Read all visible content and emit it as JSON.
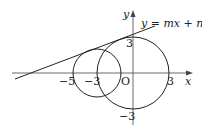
{
  "diagram": {
    "type": "coordinate-geometry",
    "axes": {
      "x_label": "x",
      "y_label": "y",
      "origin_label": "O"
    },
    "tick_labels": {
      "x_neg5": "−5",
      "x_neg3": "−3",
      "x_pos3": "3",
      "y_pos3": "3",
      "y_neg3": "−3"
    },
    "line": {
      "equation_label": "y = mx + n"
    },
    "circles": [
      {
        "name": "large-circle",
        "center": [
          0,
          0
        ],
        "radius": 3
      },
      {
        "name": "small-circle",
        "center": [
          -3,
          0
        ],
        "radius": 2
      }
    ],
    "colors": {
      "stroke": "#222222",
      "background": "#ffffff"
    }
  }
}
